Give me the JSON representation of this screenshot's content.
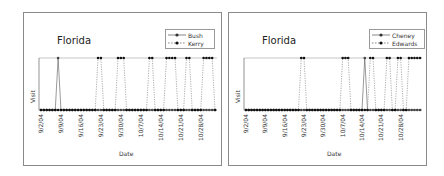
{
  "chart_data": [
    {
      "type": "line",
      "title": "Florida",
      "xlabel": "Date",
      "ylabel": "Visit",
      "x_tick_labels": [
        "9/2/04",
        "9/9/04",
        "9/16/04",
        "9/23/04",
        "9/30/04",
        "10/7/04",
        "10/14/04",
        "10/21/04",
        "10/28/04"
      ],
      "x_range_days_from_9_2_04": [
        0,
        61
      ],
      "ylim": [
        0,
        1
      ],
      "grid": false,
      "legend_position": "top-right",
      "series": [
        {
          "name": "Bush",
          "style": "solid",
          "visit_day_offsets": [
            6
          ]
        },
        {
          "name": "Kerry",
          "style": "dashed",
          "visit_day_offsets": [
            20,
            21,
            27,
            28,
            29,
            38,
            39,
            44,
            45,
            46,
            47,
            51,
            52,
            57,
            58,
            59,
            60
          ]
        }
      ]
    },
    {
      "type": "line",
      "title": "Florida",
      "xlabel": "Date",
      "ylabel": "Visit",
      "x_tick_labels": [
        "9/2/04",
        "9/9/04",
        "9/16/04",
        "9/23/04",
        "9/30/04",
        "10/7/04",
        "10/14/04",
        "10/21/04",
        "10/28/04"
      ],
      "x_range_days_from_9_2_04": [
        0,
        63
      ],
      "ylim": [
        0,
        1
      ],
      "grid": false,
      "legend_position": "top-right",
      "series": [
        {
          "name": "Cheney",
          "style": "solid",
          "visit_day_offsets": [
            43
          ]
        },
        {
          "name": "Edwards",
          "style": "dashed",
          "visit_day_offsets": [
            20,
            21,
            35,
            36,
            37,
            45,
            46,
            51,
            52,
            55,
            56,
            59,
            60,
            61,
            62,
            63
          ]
        }
      ]
    }
  ],
  "panels": [
    {
      "title": "Florida",
      "ylabel": "Visit",
      "xlabel": "Date",
      "legend": [
        "Bush",
        "Kerry"
      ]
    },
    {
      "title": "Florida",
      "ylabel": "Visit",
      "xlabel": "Date",
      "legend": [
        "Cheney",
        "Edwards"
      ]
    }
  ]
}
